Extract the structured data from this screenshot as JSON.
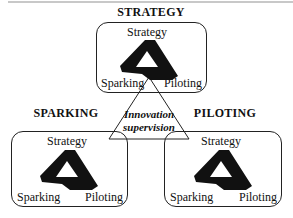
{
  "diagram": {
    "top": {
      "heading": "STRATEGY",
      "labels": {
        "top": "Strategy",
        "left": "Sparking",
        "right": "Piloting"
      }
    },
    "left": {
      "heading": "SPARKING",
      "labels": {
        "top": "Strategy",
        "left": "Sparking",
        "right": "Piloting"
      }
    },
    "right": {
      "heading": "PILOTING",
      "labels": {
        "top": "Strategy",
        "left": "Sparking",
        "right": "Piloting"
      }
    },
    "center": {
      "line1": "Innovation",
      "line2": "supervision"
    },
    "colors": {
      "stroke": "#222222",
      "shape_fill": "#111111",
      "background": "#ffffff"
    }
  }
}
